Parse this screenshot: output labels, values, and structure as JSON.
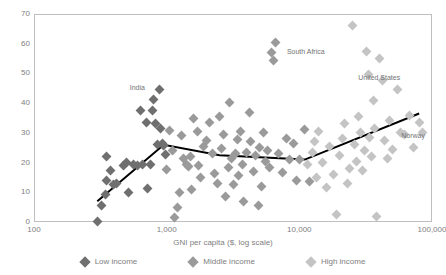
{
  "chart_data": {
    "type": "scatter",
    "title": "",
    "xlabel": "GNI per capita ($, log scale)",
    "ylabel": "",
    "xscale": "log",
    "xlim": [
      100,
      100000
    ],
    "ylim": [
      0,
      70
    ],
    "grid": false,
    "frame": true,
    "legend_position": "bottom",
    "xticks": [
      "100",
      "1,000",
      "10,000",
      "100,000"
    ],
    "xtick_values": [
      100,
      1000,
      10000,
      100000
    ],
    "yticks": [
      "0",
      "10",
      "20",
      "30",
      "40",
      "50",
      "60",
      "70"
    ],
    "ytick_values": [
      0,
      10,
      20,
      30,
      40,
      50,
      60,
      70
    ],
    "colors": {
      "low_income": "#6f6f6f",
      "middle_income": "#9a9a9a",
      "high_income": "#c4c4c4",
      "trendline": "#000000",
      "frame": "#bfbfbf",
      "text": "#808080"
    },
    "series": [
      {
        "name": "Low income",
        "color": "#6f6f6f",
        "points": [
          [
            300,
            0.3
          ],
          [
            320,
            5.5
          ],
          [
            345,
            9.2
          ],
          [
            350,
            14.0
          ],
          [
            355,
            22.2
          ],
          [
            380,
            17.5
          ],
          [
            400,
            12.6
          ],
          [
            420,
            13.0
          ],
          [
            470,
            18.9
          ],
          [
            500,
            20.1
          ],
          [
            520,
            10.0
          ],
          [
            560,
            19.3
          ],
          [
            600,
            19.0
          ],
          [
            640,
            37.5
          ],
          [
            660,
            19.2
          ],
          [
            700,
            33.5
          ],
          [
            720,
            11.4
          ],
          [
            760,
            19.4
          ],
          [
            780,
            37.6
          ],
          [
            800,
            41.3
          ],
          [
            820,
            33.0
          ],
          [
            850,
            26.0
          ],
          [
            880,
            44.6
          ],
          [
            900,
            31.5
          ],
          [
            930,
            26.3
          ],
          [
            950,
            25.9
          ],
          [
            980,
            22.8
          ]
        ]
      },
      {
        "name": "Middle income",
        "color": "#9a9a9a",
        "points": [
          [
            1000,
            17.6
          ],
          [
            1050,
            30.8
          ],
          [
            1100,
            24.0
          ],
          [
            1150,
            1.4
          ],
          [
            1200,
            5.0
          ],
          [
            1250,
            9.9
          ],
          [
            1300,
            29.0
          ],
          [
            1350,
            21.5
          ],
          [
            1400,
            19.3
          ],
          [
            1450,
            18.7
          ],
          [
            1500,
            22.0
          ],
          [
            1550,
            10.8
          ],
          [
            1600,
            34.8
          ],
          [
            1700,
            30.3
          ],
          [
            1750,
            19.0
          ],
          [
            1800,
            15.0
          ],
          [
            1900,
            25.5
          ],
          [
            2000,
            27.5
          ],
          [
            2100,
            33.5
          ],
          [
            2200,
            23.0
          ],
          [
            2300,
            16.4
          ],
          [
            2400,
            13.0
          ],
          [
            2500,
            35.5
          ],
          [
            2600,
            24.7
          ],
          [
            2700,
            29.3
          ],
          [
            2800,
            8.5
          ],
          [
            2900,
            18.2
          ],
          [
            3000,
            40.2
          ],
          [
            3100,
            21.5
          ],
          [
            3200,
            12.5
          ],
          [
            3300,
            23.2
          ],
          [
            3400,
            27.7
          ],
          [
            3500,
            15.5
          ],
          [
            3600,
            30.5
          ],
          [
            3700,
            19.5
          ],
          [
            3800,
            7.0
          ],
          [
            4000,
            23.5
          ],
          [
            4200,
            37.0
          ],
          [
            4300,
            27.0
          ],
          [
            4500,
            17.0
          ],
          [
            4700,
            22.5
          ],
          [
            4900,
            5.5
          ],
          [
            5000,
            25.0
          ],
          [
            5200,
            12.0
          ],
          [
            5400,
            30.0
          ],
          [
            5600,
            20.5
          ],
          [
            5800,
            24.0
          ],
          [
            6000,
            18.5
          ],
          [
            6200,
            57.0
          ],
          [
            6400,
            54.5
          ],
          [
            6600,
            60.5
          ],
          [
            7000,
            23.0
          ],
          [
            7500,
            16.5
          ],
          [
            8000,
            28.0
          ],
          [
            8500,
            21.0
          ],
          [
            9000,
            26.5
          ],
          [
            9500,
            14.0
          ],
          [
            10000,
            21.0
          ],
          [
            11000,
            31.0
          ],
          [
            12000,
            13.5
          ]
        ]
      },
      {
        "name": "High income",
        "color": "#c4c4c4",
        "points": [
          [
            11500,
            19.5
          ],
          [
            12500,
            23.5
          ],
          [
            13000,
            27.0
          ],
          [
            13500,
            15.0
          ],
          [
            14000,
            30.5
          ],
          [
            15000,
            20.0
          ],
          [
            16000,
            11.5
          ],
          [
            17000,
            25.5
          ],
          [
            18000,
            16.0
          ],
          [
            19000,
            2.5
          ],
          [
            20000,
            22.5
          ],
          [
            21000,
            28.0
          ],
          [
            22000,
            33.0
          ],
          [
            23000,
            13.0
          ],
          [
            24000,
            18.0
          ],
          [
            25000,
            66.0
          ],
          [
            26000,
            26.0
          ],
          [
            27000,
            20.5
          ],
          [
            28000,
            35.5
          ],
          [
            29000,
            30.0
          ],
          [
            30000,
            17.5
          ],
          [
            31000,
            24.0
          ],
          [
            32000,
            57.5
          ],
          [
            33000,
            49.5
          ],
          [
            34000,
            28.5
          ],
          [
            35000,
            22.0
          ],
          [
            36000,
            41.0
          ],
          [
            37000,
            31.5
          ],
          [
            38000,
            2.0
          ],
          [
            40000,
            55.0
          ],
          [
            42000,
            47.5
          ],
          [
            44000,
            27.5
          ],
          [
            46000,
            21.5
          ],
          [
            48000,
            34.0
          ],
          [
            50000,
            24.5
          ],
          [
            55000,
            44.5
          ],
          [
            58000,
            30.0
          ],
          [
            62000,
            29.5
          ],
          [
            68000,
            36.0
          ],
          [
            72000,
            25.0
          ],
          [
            80000,
            33.5
          ],
          [
            85000,
            30.0
          ]
        ]
      }
    ],
    "trendline": {
      "color": "#000000",
      "width": 2,
      "points": [
        [
          300,
          7.0
        ],
        [
          950,
          26.0
        ],
        [
          2500,
          22.5
        ],
        [
          11000,
          21.0
        ],
        [
          80000,
          36.5
        ]
      ]
    },
    "annotations": [
      {
        "label": "India",
        "x": 880,
        "y": 44.6,
        "dx": -22,
        "dy": -1
      },
      {
        "label": "South Africa",
        "x": 6200,
        "y": 57.0,
        "dx": 34,
        "dy": -1
      },
      {
        "label": "United States",
        "x": 40000,
        "y": 55.0,
        "dx": 0,
        "dy": 19
      },
      {
        "label": "Norway",
        "x": 80000,
        "y": 33.5,
        "dx": -6,
        "dy": 14
      }
    ]
  },
  "legend": {
    "items": [
      {
        "label": "Low income",
        "color": "#6f6f6f"
      },
      {
        "label": "Middle income",
        "color": "#9a9a9a"
      },
      {
        "label": "High income",
        "color": "#c4c4c4"
      }
    ]
  }
}
